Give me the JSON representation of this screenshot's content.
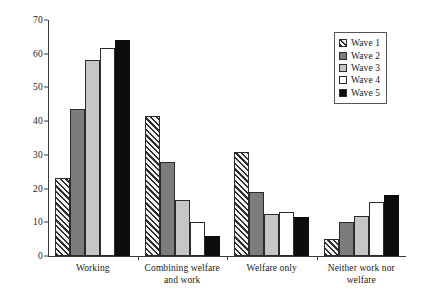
{
  "chart_data": {
    "type": "bar",
    "title": "",
    "xlabel": "",
    "ylabel": "Percent",
    "ylim": [
      0,
      70
    ],
    "yticks": [
      "0",
      "10",
      "20",
      "30",
      "40",
      "50",
      "60",
      "70"
    ],
    "grid": false,
    "legend_position": "top-right",
    "categories": [
      "Working",
      "Combining welfare and work",
      "Welfare only",
      "Neither work nor welfare"
    ],
    "series": [
      {
        "name": "Wave 1",
        "values": [
          23,
          41.5,
          30.8,
          5
        ],
        "fill": "diagonal-hatch",
        "color": "#d6d6d6"
      },
      {
        "name": "Wave 2",
        "values": [
          43.5,
          27.8,
          19,
          10
        ],
        "fill": "solid",
        "color": "#7c7c7c"
      },
      {
        "name": "Wave 3",
        "values": [
          58,
          16.5,
          12.5,
          12
        ],
        "fill": "solid",
        "color": "#c6c6c6"
      },
      {
        "name": "Wave 4",
        "values": [
          61.7,
          10,
          13,
          16
        ],
        "fill": "solid",
        "color": "#ffffff"
      },
      {
        "name": "Wave 5",
        "values": [
          64,
          5.8,
          11.7,
          18.2
        ],
        "fill": "solid",
        "color": "#0d0d0d"
      }
    ]
  }
}
